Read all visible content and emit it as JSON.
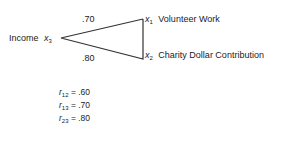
{
  "diagram": {
    "nodes": {
      "x3": {
        "name": "Income",
        "var": "x",
        "sub": "3"
      },
      "x1": {
        "name": "Volunteer Work",
        "var": "x",
        "sub": "1"
      },
      "x2": {
        "name": "Charity Dollar Contribution",
        "var": "x",
        "sub": "2"
      }
    },
    "edges": {
      "x3_x1": ".70",
      "x3_x2": ".80"
    },
    "line_color": "#333333"
  },
  "correlations": [
    {
      "var": "r",
      "sub": "12",
      "eq": " = .60"
    },
    {
      "var": "r",
      "sub": "13",
      "eq": " = .70"
    },
    {
      "var": "r",
      "sub": "23",
      "eq": " = .80"
    }
  ]
}
